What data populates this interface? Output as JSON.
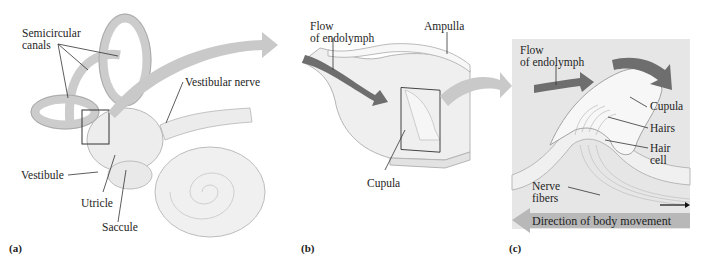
{
  "figure": {
    "panels": [
      {
        "tag": "(a)",
        "labels": {
          "semicircular_canals_1": "Semicircular",
          "semicircular_canals_2": "canals",
          "vestibular_nerve": "Vestibular nerve",
          "vestibule": "Vestibule",
          "utricle": "Utricle",
          "saccule": "Saccule"
        }
      },
      {
        "tag": "(b)",
        "labels": {
          "flow_1": "Flow",
          "flow_2": "of endolymph",
          "ampulla": "Ampulla",
          "cupula": "Cupula"
        }
      },
      {
        "tag": "(c)",
        "labels": {
          "flow_1": "Flow",
          "flow_2": "of endolymph",
          "cupula": "Cupula",
          "hairs": "Hairs",
          "hair_cell_1": "Hair",
          "hair_cell_2": "cell",
          "nerve_fibers_1": "Nerve",
          "nerve_fibers_2": "fibers",
          "direction": "Direction of body movement"
        }
      }
    ],
    "colors": {
      "flow_arrow": "#6e6e6e",
      "connector_arrow": "#c9c9c9",
      "tissue_fill": "#efefef",
      "tissue_stroke": "#b5b5b5",
      "panel_c_bg": "#e6e6e6",
      "direction_arrow": "#b8b8b8"
    }
  }
}
